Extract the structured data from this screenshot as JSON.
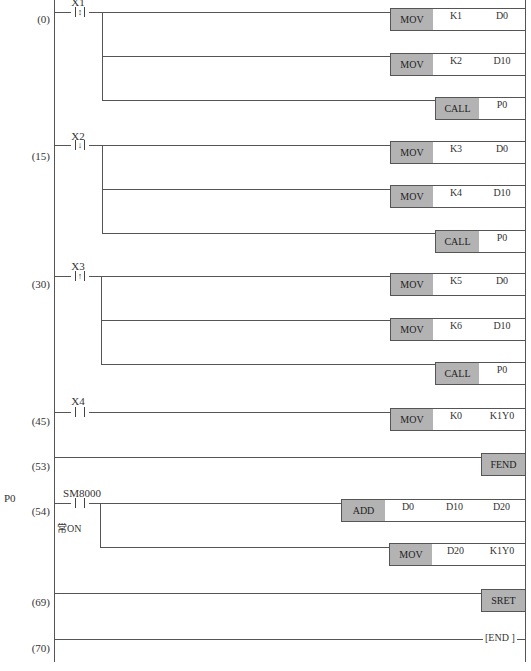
{
  "diagram": {
    "type": "ladder",
    "subroutine_label": "P0",
    "rungs": [
      {
        "step": "(0)",
        "contact": {
          "name": "X1",
          "type": "edge",
          "glyph": "↕"
        },
        "outputs": [
          {
            "op": "MOV",
            "args": [
              "K1",
              "D0"
            ]
          },
          {
            "op": "MOV",
            "args": [
              "K2",
              "D10"
            ]
          },
          {
            "op": "CALL",
            "args": [
              "P0"
            ]
          }
        ]
      },
      {
        "step": "(15)",
        "contact": {
          "name": "X2",
          "type": "edge",
          "glyph": "↓"
        },
        "outputs": [
          {
            "op": "MOV",
            "args": [
              "K3",
              "D0"
            ]
          },
          {
            "op": "MOV",
            "args": [
              "K4",
              "D10"
            ]
          },
          {
            "op": "CALL",
            "args": [
              "P0"
            ]
          }
        ]
      },
      {
        "step": "(30)",
        "contact": {
          "name": "X3",
          "type": "edge",
          "glyph": "↑"
        },
        "outputs": [
          {
            "op": "MOV",
            "args": [
              "K5",
              "D0"
            ]
          },
          {
            "op": "MOV",
            "args": [
              "K6",
              "D10"
            ]
          },
          {
            "op": "CALL",
            "args": [
              "P0"
            ]
          }
        ]
      },
      {
        "step": "(45)",
        "contact": {
          "name": "X4",
          "type": "no"
        },
        "outputs": [
          {
            "op": "MOV",
            "args": [
              "K0",
              "K1Y0"
            ]
          }
        ]
      },
      {
        "step": "(53)",
        "outputs": [
          {
            "op": "FEND"
          }
        ]
      },
      {
        "step": "(54)",
        "contact": {
          "name": "SM8000",
          "type": "no",
          "comment": "常ON"
        },
        "outputs": [
          {
            "op": "ADD",
            "args": [
              "D0",
              "D10",
              "D20"
            ]
          },
          {
            "op": "MOV",
            "args": [
              "D20",
              "K1Y0"
            ]
          }
        ]
      },
      {
        "step": "(69)",
        "outputs": [
          {
            "op": "SRET"
          }
        ]
      },
      {
        "step": "(70)",
        "outputs": [
          {
            "op": "[END ]"
          }
        ]
      }
    ]
  },
  "colors": {
    "instruction_fill": "#b3b3b3",
    "line": "#555555",
    "background": "#ffffff"
  }
}
